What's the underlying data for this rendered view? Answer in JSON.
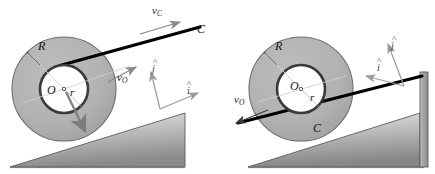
{
  "figure": {
    "background": "#ffffff",
    "width": 435,
    "height": 174
  },
  "colors": {
    "wheel_fill": "#b2b2b2",
    "wheel_edge": "#6e6e6e",
    "hub_fill": "#ffffff",
    "hub_ring": "#3a3a3a",
    "cord": "#000000",
    "incline_light": "#d8d8d8",
    "incline_dark": "#8e8e8e",
    "incline_edge": "#555555",
    "vector_gray": "#8a8a8a",
    "label_text": "#181818",
    "axis_gray": "#9a9a9a",
    "post_fill": "#9c9c9c"
  },
  "panels": [
    {
      "id": "left-panel",
      "name": "cord-on-top-of-hub",
      "wheel": {
        "center": {
          "x": 64,
          "y": 89
        },
        "outer_radius": 52,
        "inner_radius": 24,
        "label_R": "R",
        "label_r": "r",
        "label_O": "O"
      },
      "cord": {
        "label_point": "C",
        "tangent_side": "top",
        "direction": "up-right"
      },
      "vectors": [
        {
          "name": "v_C",
          "base": "v",
          "sub": "C",
          "direction": "up-right",
          "style": "thin-gray"
        },
        {
          "name": "v_O",
          "base": "v",
          "sub": "O",
          "direction": "up-right",
          "style": "thin-gray"
        },
        {
          "name": "contact-arrow",
          "base": "",
          "sub": "",
          "direction": "down-right",
          "style": "thick-gray"
        }
      ],
      "axes": [
        {
          "label": "i",
          "hat": true,
          "direction": "up-right-shallow"
        },
        {
          "label": "j",
          "hat": true,
          "direction": "up-left-steep"
        }
      ],
      "incline": {
        "angle_deg": 17,
        "rises": "left-to-right"
      }
    },
    {
      "id": "right-panel",
      "name": "cord-under-hub",
      "wheel": {
        "center": {
          "x": 301,
          "y": 89
        },
        "outer_radius": 52,
        "inner_radius": 24,
        "label_R": "R",
        "label_r": "r",
        "label_O": "O"
      },
      "cord": {
        "label_point": "C",
        "tangent_side": "bottom",
        "direction": "down-left"
      },
      "vectors": [
        {
          "name": "v_O",
          "base": "v",
          "sub": "O",
          "direction": "down-left",
          "style": "thin-black"
        }
      ],
      "axes": [
        {
          "label": "i",
          "hat": true,
          "direction": "down-left-shallow"
        },
        {
          "label": "j",
          "hat": true,
          "direction": "up-left-steep"
        }
      ],
      "incline": {
        "angle_deg": 17,
        "rises": "left-to-right",
        "has_post": true
      }
    }
  ],
  "labels": {
    "v": "v",
    "sub_C": "C",
    "sub_O": "O",
    "C": "C",
    "O": "O",
    "R": "R",
    "r": "r",
    "i": "i",
    "j": "j",
    "hat": "^"
  }
}
